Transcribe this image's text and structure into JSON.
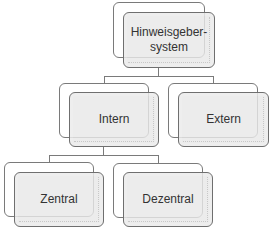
{
  "diagram": {
    "root": {
      "label": "Hinweisgeber-\nsystem"
    },
    "level1": [
      {
        "label": "Intern"
      },
      {
        "label": "Extern"
      }
    ],
    "level2": [
      {
        "label": "Zentral"
      },
      {
        "label": "Dezentral"
      }
    ]
  },
  "colors": {
    "box_fill": "#e8e8e8",
    "box_border": "#6f6f6f",
    "connector": "#7a7a7a",
    "text": "#333333"
  }
}
